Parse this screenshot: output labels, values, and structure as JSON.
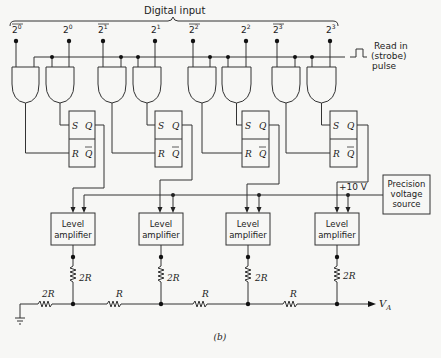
{
  "title": "Digital input",
  "inputs": [
    {
      "label": "2",
      "exp": "0",
      "inverted": true
    },
    {
      "label": "2",
      "exp": "0",
      "inverted": false
    },
    {
      "label": "2",
      "exp": "1",
      "inverted": true
    },
    {
      "label": "2",
      "exp": "1",
      "inverted": false
    },
    {
      "label": "2",
      "exp": "2",
      "inverted": true
    },
    {
      "label": "2",
      "exp": "2",
      "inverted": false
    },
    {
      "label": "2",
      "exp": "3",
      "inverted": true
    },
    {
      "label": "2",
      "exp": "3",
      "inverted": false
    }
  ],
  "strobe": {
    "line1": "Read in",
    "line2": "(strobe)",
    "line3": "pulse"
  },
  "flipflop": {
    "s": "S",
    "q": "Q",
    "r": "R",
    "qbar": "Q"
  },
  "level_amp": {
    "line1": "Level",
    "line2": "amplifier"
  },
  "reference": {
    "voltage": "+10 V",
    "line1": "Precision",
    "line2": "voltage",
    "line3": "source"
  },
  "ladder": {
    "shunt": "2R",
    "series": "R",
    "termination": "2R",
    "output": "V",
    "output_sub": "A"
  },
  "caption": "(b)",
  "colors": {
    "line": "#333333",
    "background": "#f7f7f5"
  }
}
